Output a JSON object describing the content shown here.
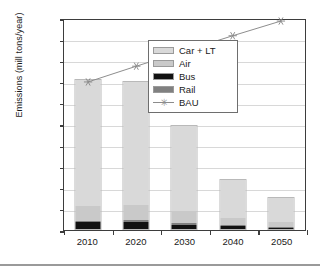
{
  "chart_data": {
    "type": "bar",
    "subtype": "stacked-bar-with-line",
    "title": "",
    "xlabel": "",
    "ylabel": "Emissions (mill tons/year)",
    "categories": [
      "2010",
      "2020",
      "2030",
      "2040",
      "2050"
    ],
    "ylim": [
      0,
      2000
    ],
    "ytick_labels": [
      "2,000",
      "1,800",
      "1,600",
      "1,400",
      "1,200",
      "1,000",
      "800",
      "600",
      "400",
      "200",
      "–"
    ],
    "ytick_values": [
      2000,
      1800,
      1600,
      1400,
      1200,
      1000,
      800,
      600,
      400,
      200,
      0
    ],
    "grid": true,
    "legend_position": "inside-upper-right",
    "series": [
      {
        "name": "Bus",
        "type": "bar",
        "color": "#111111",
        "values": [
          62,
          66,
          40,
          24,
          14
        ]
      },
      {
        "name": "Rail",
        "type": "bar",
        "color": "#808080",
        "values": [
          18,
          20,
          16,
          12,
          8
        ]
      },
      {
        "name": "Air",
        "type": "bar",
        "color": "#c9c9c9",
        "values": [
          140,
          145,
          112,
          66,
          42
        ]
      },
      {
        "name": "Car + LT",
        "type": "bar",
        "color": "#d9d9d9",
        "values": [
          1190,
          1154,
          802,
          358,
          226
        ]
      },
      {
        "name": "BAU",
        "type": "line",
        "color": "#8c8c8c",
        "marker": "asterisk",
        "values": [
          1410,
          1560,
          1705,
          1850,
          1990
        ]
      }
    ],
    "bar_totals": [
      1410,
      1385,
      970,
      460,
      290
    ]
  },
  "legend": {
    "entries": [
      {
        "label": "Car + LT",
        "swatch": "#d9d9d9",
        "kind": "swatch"
      },
      {
        "label": "Air",
        "swatch": "#c9c9c9",
        "kind": "swatch"
      },
      {
        "label": "Bus",
        "swatch": "#111111",
        "kind": "swatch"
      },
      {
        "label": "Rail",
        "swatch": "#808080",
        "kind": "swatch"
      },
      {
        "label": "BAU",
        "swatch": "#8c8c8c",
        "kind": "line",
        "marker": "✳"
      }
    ]
  }
}
